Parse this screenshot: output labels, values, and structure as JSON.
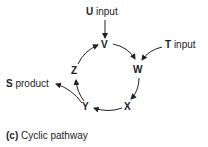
{
  "diagram": {
    "nodes": {
      "V": "V",
      "W": "W",
      "X": "X",
      "Y": "Y",
      "Z": "Z"
    },
    "inputs": {
      "U": {
        "letter": "U",
        "text": " input"
      },
      "T": {
        "letter": "T",
        "text": " input"
      }
    },
    "outputs": {
      "S": {
        "letter": "S",
        "text": " product"
      }
    },
    "edges": [
      {
        "from": "U input",
        "to": "V"
      },
      {
        "from": "V",
        "to": "W"
      },
      {
        "from": "T input",
        "to": "W"
      },
      {
        "from": "W",
        "to": "X"
      },
      {
        "from": "X",
        "to": "Y"
      },
      {
        "from": "Y",
        "to": "Z"
      },
      {
        "from": "Y",
        "to": "S product"
      },
      {
        "from": "Z",
        "to": "V"
      }
    ],
    "caption": {
      "label": "(c)",
      "text": " Cyclic pathway"
    }
  }
}
